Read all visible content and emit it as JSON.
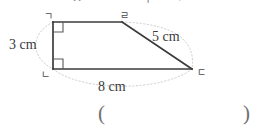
{
  "page": {
    "background_color": "#ffffff",
    "ink_color": "#3b3b3b",
    "guide_color": "#c9c9c9",
    "top_clipped_text": "ㅁ ㅁ ㅁ ㄴ ㅁ ㅊ ㅁㅁㅡ ㅁㅡㅣ ㅁ ㄱ"
  },
  "figure": {
    "type": "right-trapezoid",
    "shape_name": "사각형 ㄱㄴㄷㄹ",
    "vertices": [
      {
        "id": "top-left",
        "label": "ㄱ",
        "x": 53,
        "y": 22
      },
      {
        "id": "top-right",
        "label": "ㄹ",
        "x": 122,
        "y": 22
      },
      {
        "id": "bottom-right",
        "label": "ㄷ",
        "x": 192,
        "y": 69
      },
      {
        "id": "bottom-left",
        "label": "ㄴ",
        "x": 53,
        "y": 69
      }
    ],
    "right_angle_marks": [
      {
        "at": "top-left",
        "x": 53,
        "y": 22
      },
      {
        "at": "bottom-left",
        "x": 53,
        "y": 69
      }
    ],
    "side_labels": {
      "left": "3 cm",
      "slant": "5 cm",
      "bottom": "8 cm"
    },
    "measurements": {
      "left_side_cm": 3,
      "slant_side_cm": 5,
      "bottom_side_cm": 8
    }
  },
  "answer": {
    "open_paren": "(",
    "close_paren": ")",
    "value": ""
  }
}
